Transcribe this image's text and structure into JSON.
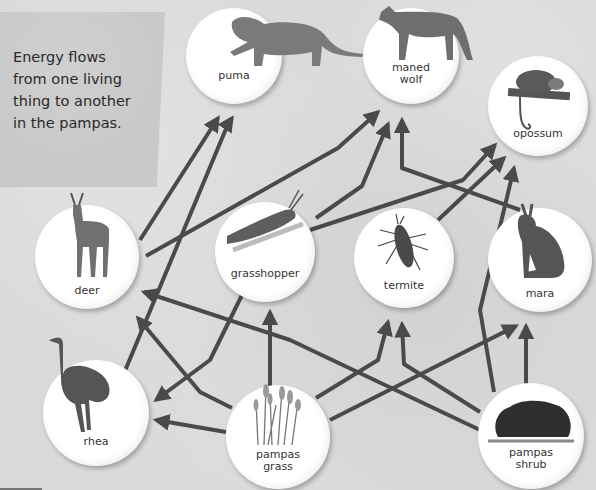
{
  "caption": {
    "lines": [
      "Energy flows",
      "from one living",
      "thing to another",
      "in the pampas."
    ]
  },
  "organisms": {
    "puma": {
      "label": "puma",
      "icon": "puma-icon"
    },
    "maned_wolf": {
      "label_line1": "maned",
      "label_line2": "wolf",
      "icon": "maned-wolf-icon"
    },
    "opossum": {
      "label": "opossum",
      "icon": "opossum-icon"
    },
    "deer": {
      "label": "deer",
      "icon": "deer-icon"
    },
    "grasshopper": {
      "label": "grasshopper",
      "icon": "grasshopper-icon"
    },
    "termite": {
      "label": "termite",
      "icon": "termite-icon"
    },
    "mara": {
      "label": "mara",
      "icon": "mara-icon"
    },
    "rhea": {
      "label": "rhea",
      "icon": "rhea-icon"
    },
    "pampas_grass": {
      "label_line1": "pampas",
      "label_line2": "grass",
      "icon": "pampas-grass-icon"
    },
    "pampas_shrub": {
      "label_line1": "pampas",
      "label_line2": "shrub",
      "icon": "pampas-shrub-icon"
    }
  },
  "energy_flows": [
    {
      "from": "deer",
      "to": "puma"
    },
    {
      "from": "rhea",
      "to": "puma"
    },
    {
      "from": "deer",
      "to": "maned_wolf"
    },
    {
      "from": "grasshopper",
      "to": "maned_wolf"
    },
    {
      "from": "mara",
      "to": "maned_wolf"
    },
    {
      "from": "grasshopper",
      "to": "opossum"
    },
    {
      "from": "termite",
      "to": "opossum"
    },
    {
      "from": "pampas_shrub",
      "to": "opossum"
    },
    {
      "from": "grasshopper",
      "to": "rhea"
    },
    {
      "from": "pampas_grass",
      "to": "rhea"
    },
    {
      "from": "pampas_grass",
      "to": "deer"
    },
    {
      "from": "pampas_shrub",
      "to": "deer"
    },
    {
      "from": "pampas_grass",
      "to": "grasshopper"
    },
    {
      "from": "pampas_grass",
      "to": "termite"
    },
    {
      "from": "pampas_shrub",
      "to": "termite"
    },
    {
      "from": "pampas_grass",
      "to": "mara"
    },
    {
      "from": "pampas_shrub",
      "to": "mara"
    }
  ],
  "colors": {
    "arrow": "#4a4a4a",
    "node_fill": "#ffffff",
    "background": "#d9d9d9"
  }
}
